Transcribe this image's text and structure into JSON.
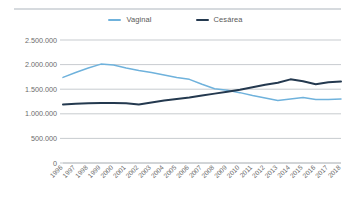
{
  "chart_data": {
    "type": "line",
    "title": "",
    "subtitle": "",
    "xlabel": "",
    "ylabel": "",
    "ylim": [
      0,
      2500000
    ],
    "yticks": [
      0,
      500000,
      1000000,
      1500000,
      2000000,
      2500000
    ],
    "ytick_labels": [
      "0",
      "500.000",
      "1.000.000",
      "1.500.000",
      "2.000.000",
      "2.500.000"
    ],
    "grid": true,
    "legend_position": "top-center",
    "categories": [
      "1996",
      "1997",
      "1998",
      "1999",
      "2000",
      "2001",
      "2002",
      "2003",
      "2004",
      "2005",
      "2006",
      "2007",
      "2008",
      "2009",
      "2010",
      "2011",
      "2012",
      "2013",
      "2014",
      "2015",
      "2016",
      "2017",
      "2018"
    ],
    "series": [
      {
        "name": "Vaginal",
        "color": "#6FB2DC",
        "values": [
          1740000,
          1840000,
          1930000,
          2010000,
          1990000,
          1930000,
          1880000,
          1840000,
          1790000,
          1740000,
          1700000,
          1600000,
          1510000,
          1480000,
          1430000,
          1370000,
          1320000,
          1270000,
          1300000,
          1330000,
          1290000,
          1290000,
          1300000
        ]
      },
      {
        "name": "Cesárea",
        "color": "#24394F",
        "values": [
          1190000,
          1205000,
          1215000,
          1220000,
          1220000,
          1215000,
          1190000,
          1230000,
          1270000,
          1300000,
          1330000,
          1370000,
          1410000,
          1450000,
          1490000,
          1540000,
          1590000,
          1630000,
          1700000,
          1660000,
          1600000,
          1640000,
          1655000
        ]
      }
    ]
  },
  "legend": {
    "items": [
      {
        "label": "Vaginal",
        "color": "#6FB2DC"
      },
      {
        "label": "Cesárea",
        "color": "#24394F"
      }
    ]
  }
}
